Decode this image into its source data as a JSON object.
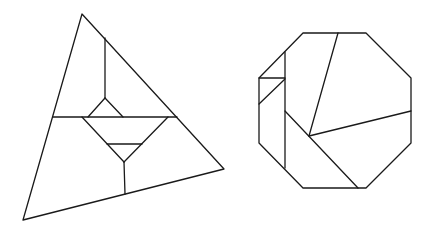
{
  "figure": {
    "background": "#ffffff",
    "stroke": "#1a1a1a",
    "shapes": [
      {
        "name": "dissected-triangle",
        "outline": [
          [
            82,
            14
          ],
          [
            224,
            169
          ],
          [
            23,
            220
          ]
        ],
        "segments": [
          [
            105,
            38,
            105,
            98
          ],
          [
            53,
            117,
            177,
            117
          ],
          [
            105,
            98,
            88,
            117
          ],
          [
            105,
            98,
            123,
            117
          ],
          [
            82,
            117,
            124,
            162
          ],
          [
            168,
            117,
            124,
            162
          ],
          [
            107,
            144,
            142,
            144
          ],
          [
            124,
            162,
            125,
            194
          ]
        ]
      },
      {
        "name": "dissected-octagon",
        "outline": [
          [
            303,
            33
          ],
          [
            366,
            33
          ],
          [
            411,
            78
          ],
          [
            411,
            143
          ],
          [
            366,
            188
          ],
          [
            303,
            188
          ],
          [
            259,
            143
          ],
          [
            259,
            78
          ]
        ],
        "segments": [
          [
            285,
            52,
            285,
            168
          ],
          [
            259,
            78,
            285,
            78
          ],
          [
            259,
            104,
            285,
            79
          ],
          [
            338,
            33,
            309,
            136
          ],
          [
            309,
            136,
            411,
            111
          ],
          [
            285,
            111,
            358,
            188
          ]
        ]
      }
    ]
  }
}
